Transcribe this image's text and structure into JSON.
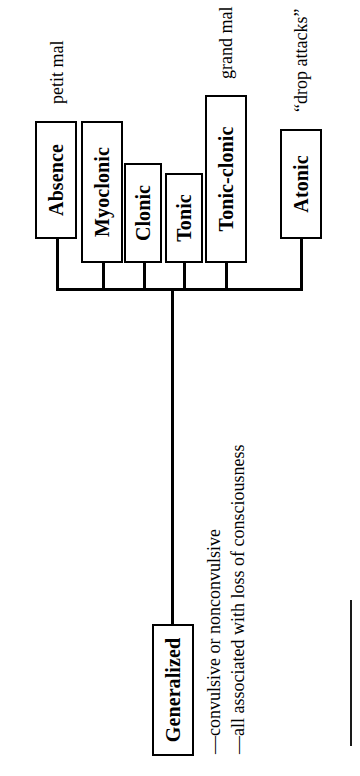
{
  "diagram": {
    "type": "hierarchy-tree",
    "orientation": "page rotated 90 degrees counter-clockwise",
    "ink_color": "#000000",
    "background_color": "#ffffff",
    "root": {
      "label": "Generalized",
      "bullets": [
        "—convulsive or nonconvulsive",
        "—all associated with loss of consciousness"
      ]
    },
    "children": [
      {
        "label": "Absence",
        "annotation": "petit mal"
      },
      {
        "label": "Myoclonic",
        "annotation": ""
      },
      {
        "label": "Clonic",
        "annotation": ""
      },
      {
        "label": "Tonic",
        "annotation": ""
      },
      {
        "label": "Tonic-clonic",
        "annotation": "grand mal"
      },
      {
        "label": "Atonic",
        "annotation": "“drop attacks”"
      }
    ]
  }
}
